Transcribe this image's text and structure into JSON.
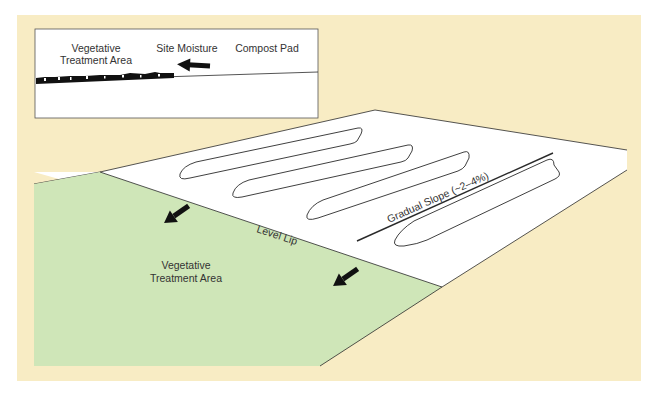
{
  "colors": {
    "panel_bg": "#f8ecc4",
    "pad_fill": "#ffffff",
    "vta_fill": "#cfe6b8",
    "line": "#2a2a2a",
    "arrow": "#111111",
    "text": "#333333"
  },
  "inset": {
    "labels": {
      "vta_line1": "Vegetative",
      "vta_line2": "Treatment Area",
      "site_moisture": "Site Moisture",
      "compost_pad": "Compost Pad"
    }
  },
  "main": {
    "labels": {
      "level_lip": "Level Lip",
      "gradual_slope": "Gradual Slope (~2–4%)",
      "vta_line1": "Vegetative",
      "vta_line2": "Treatment Area"
    },
    "windrow_count": 4,
    "flow_arrow_count": 2
  },
  "caption": ""
}
